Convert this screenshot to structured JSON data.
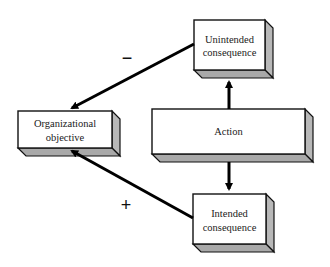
{
  "diagram": {
    "colors": {
      "face": "#ffffff",
      "side": "#b8b8b8",
      "bottom": "#a9a9a9",
      "stroke": "#111111",
      "arrow": "#000000"
    },
    "nodes": {
      "organizational_objective": {
        "line1": "Organizational",
        "line2": "objective"
      },
      "unintended_consequence": {
        "line1": "Unintended",
        "line2": "consequence"
      },
      "action": {
        "label": "Action"
      },
      "intended_consequence": {
        "line1": "Intended",
        "line2": "consequence"
      }
    },
    "edges": {
      "unintended_to_objective": {
        "sign": "−"
      },
      "intended_to_objective": {
        "sign": "+"
      },
      "action_to_unintended": {
        "sign": ""
      },
      "action_to_intended": {
        "sign": ""
      }
    }
  }
}
